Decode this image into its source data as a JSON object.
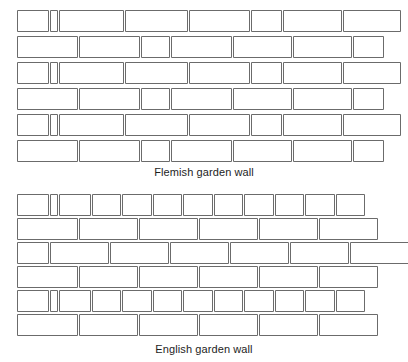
{
  "page": {
    "background_color": "#ffffff",
    "brick_fill": "#ffffff",
    "brick_stroke": "#6b6b6b",
    "text_color": "#1d1d1d",
    "width": 408,
    "height": 362
  },
  "diagrams": [
    {
      "id": "flemish",
      "caption": "Flemish garden wall",
      "bond_type": "flemish-garden-wall",
      "origin_x": 17,
      "origin_y": 10,
      "course_height": 21,
      "course_gap": 5,
      "courses": [
        {
          "index": 1,
          "y": 10,
          "bricks": [
            {
              "type": "header",
              "x": 17,
              "w": 31
            },
            {
              "type": "queen-closer",
              "x": 50,
              "w": 7
            },
            {
              "type": "stretcher",
              "x": 59,
              "w": 64
            },
            {
              "type": "stretcher",
              "x": 125,
              "w": 62
            },
            {
              "type": "stretcher",
              "x": 189,
              "w": 60
            },
            {
              "type": "header",
              "x": 251,
              "w": 30
            },
            {
              "type": "stretcher",
              "x": 283,
              "w": 58
            },
            {
              "type": "stretcher",
              "x": 343,
              "w": 57
            }
          ]
        },
        {
          "index": 2,
          "y": 36,
          "bricks": [
            {
              "type": "stretcher",
              "x": 17,
              "w": 60
            },
            {
              "type": "stretcher",
              "x": 79,
              "w": 60
            },
            {
              "type": "header",
              "x": 141,
              "w": 28
            },
            {
              "type": "stretcher",
              "x": 171,
              "w": 60
            },
            {
              "type": "stretcher",
              "x": 233,
              "w": 58
            },
            {
              "type": "stretcher",
              "x": 293,
              "w": 58
            },
            {
              "type": "header",
              "x": 353,
              "w": 30
            }
          ]
        },
        {
          "index": 3,
          "y": 62,
          "bricks": [
            {
              "type": "header",
              "x": 17,
              "w": 31
            },
            {
              "type": "queen-closer",
              "x": 50,
              "w": 7
            },
            {
              "type": "stretcher",
              "x": 59,
              "w": 64
            },
            {
              "type": "stretcher",
              "x": 125,
              "w": 62
            },
            {
              "type": "stretcher",
              "x": 189,
              "w": 60
            },
            {
              "type": "header",
              "x": 251,
              "w": 30
            },
            {
              "type": "stretcher",
              "x": 283,
              "w": 58
            },
            {
              "type": "stretcher",
              "x": 343,
              "w": 57
            }
          ]
        },
        {
          "index": 4,
          "y": 88,
          "bricks": [
            {
              "type": "stretcher",
              "x": 17,
              "w": 60
            },
            {
              "type": "stretcher",
              "x": 79,
              "w": 60
            },
            {
              "type": "header",
              "x": 141,
              "w": 28
            },
            {
              "type": "stretcher",
              "x": 171,
              "w": 60
            },
            {
              "type": "stretcher",
              "x": 233,
              "w": 58
            },
            {
              "type": "stretcher",
              "x": 293,
              "w": 58
            },
            {
              "type": "header",
              "x": 353,
              "w": 30
            }
          ]
        },
        {
          "index": 5,
          "y": 114,
          "bricks": [
            {
              "type": "header",
              "x": 17,
              "w": 31
            },
            {
              "type": "queen-closer",
              "x": 50,
              "w": 7
            },
            {
              "type": "stretcher",
              "x": 59,
              "w": 64
            },
            {
              "type": "stretcher",
              "x": 125,
              "w": 62
            },
            {
              "type": "stretcher",
              "x": 189,
              "w": 60
            },
            {
              "type": "header",
              "x": 251,
              "w": 30
            },
            {
              "type": "stretcher",
              "x": 283,
              "w": 58
            },
            {
              "type": "stretcher",
              "x": 343,
              "w": 57
            }
          ]
        },
        {
          "index": 6,
          "y": 140,
          "bricks": [
            {
              "type": "stretcher",
              "x": 17,
              "w": 60
            },
            {
              "type": "stretcher",
              "x": 79,
              "w": 60
            },
            {
              "type": "header",
              "x": 141,
              "w": 28
            },
            {
              "type": "stretcher",
              "x": 171,
              "w": 60
            },
            {
              "type": "stretcher",
              "x": 233,
              "w": 58
            },
            {
              "type": "stretcher",
              "x": 293,
              "w": 58
            },
            {
              "type": "header",
              "x": 353,
              "w": 30
            }
          ]
        }
      ]
    },
    {
      "id": "english",
      "caption": "English garden wall",
      "bond_type": "english-garden-wall",
      "origin_x": 17,
      "origin_y": 9,
      "course_height": 21,
      "course_gap": 5,
      "courses": [
        {
          "index": 1,
          "y": 9,
          "bricks": [
            {
              "type": "header",
              "x": 17,
              "w": 31
            },
            {
              "type": "queen-closer",
              "x": 50,
              "w": 7
            },
            {
              "type": "header",
              "x": 59,
              "w": 31
            },
            {
              "type": "header",
              "x": 92,
              "w": 28
            },
            {
              "type": "header",
              "x": 122,
              "w": 29
            },
            {
              "type": "header",
              "x": 153,
              "w": 28
            },
            {
              "type": "header",
              "x": 183,
              "w": 29
            },
            {
              "type": "header",
              "x": 214,
              "w": 28
            },
            {
              "type": "header",
              "x": 244,
              "w": 29
            },
            {
              "type": "header",
              "x": 275,
              "w": 28
            },
            {
              "type": "header",
              "x": 305,
              "w": 29
            },
            {
              "type": "header",
              "x": 336,
              "w": 28
            }
          ]
        },
        {
          "index": 2,
          "y": 33,
          "bricks": [
            {
              "type": "stretcher",
              "x": 17,
              "w": 60
            },
            {
              "type": "stretcher",
              "x": 79,
              "w": 58
            },
            {
              "type": "stretcher",
              "x": 139,
              "w": 58
            },
            {
              "type": "stretcher",
              "x": 199,
              "w": 58
            },
            {
              "type": "stretcher",
              "x": 259,
              "w": 58
            },
            {
              "type": "stretcher",
              "x": 319,
              "w": 58
            }
          ]
        },
        {
          "index": 3,
          "y": 57,
          "bricks": [
            {
              "type": "header",
              "x": 17,
              "w": 31
            },
            {
              "type": "stretcher",
              "x": 50,
              "w": 58
            },
            {
              "type": "stretcher",
              "x": 110,
              "w": 58
            },
            {
              "type": "stretcher",
              "x": 170,
              "w": 58
            },
            {
              "type": "stretcher",
              "x": 230,
              "w": 58
            },
            {
              "type": "stretcher",
              "x": 290,
              "w": 58
            },
            {
              "type": "stretcher",
              "x": 350,
              "w": 58
            }
          ]
        },
        {
          "index": 4,
          "y": 81,
          "bricks": [
            {
              "type": "stretcher",
              "x": 17,
              "w": 60
            },
            {
              "type": "stretcher",
              "x": 79,
              "w": 58
            },
            {
              "type": "stretcher",
              "x": 139,
              "w": 58
            },
            {
              "type": "stretcher",
              "x": 199,
              "w": 58
            },
            {
              "type": "stretcher",
              "x": 259,
              "w": 58
            },
            {
              "type": "stretcher",
              "x": 319,
              "w": 58
            }
          ]
        },
        {
          "index": 5,
          "y": 105,
          "bricks": [
            {
              "type": "header",
              "x": 17,
              "w": 31
            },
            {
              "type": "queen-closer",
              "x": 50,
              "w": 7
            },
            {
              "type": "header",
              "x": 59,
              "w": 31
            },
            {
              "type": "header",
              "x": 92,
              "w": 28
            },
            {
              "type": "header",
              "x": 122,
              "w": 29
            },
            {
              "type": "header",
              "x": 153,
              "w": 28
            },
            {
              "type": "header",
              "x": 183,
              "w": 29
            },
            {
              "type": "header",
              "x": 214,
              "w": 28
            },
            {
              "type": "header",
              "x": 244,
              "w": 29
            },
            {
              "type": "header",
              "x": 275,
              "w": 28
            },
            {
              "type": "header",
              "x": 305,
              "w": 29
            },
            {
              "type": "header",
              "x": 336,
              "w": 28
            }
          ]
        },
        {
          "index": 6,
          "y": 129,
          "bricks": [
            {
              "type": "stretcher",
              "x": 17,
              "w": 60
            },
            {
              "type": "stretcher",
              "x": 79,
              "w": 58
            },
            {
              "type": "stretcher",
              "x": 139,
              "w": 58
            },
            {
              "type": "stretcher",
              "x": 199,
              "w": 58
            },
            {
              "type": "stretcher",
              "x": 259,
              "w": 58
            },
            {
              "type": "stretcher",
              "x": 319,
              "w": 58
            }
          ]
        }
      ]
    }
  ]
}
